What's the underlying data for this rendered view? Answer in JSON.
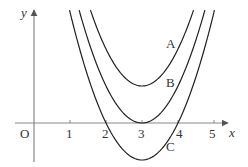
{
  "chart_data": {
    "type": "line",
    "title": "",
    "xlabel": "x",
    "ylabel": "y",
    "origin_label": "O",
    "x_ticks": [
      "1",
      "2",
      "3",
      "4",
      "5"
    ],
    "xlim": [
      -0.5,
      5.5
    ],
    "ylim": [
      -1.2,
      3.1
    ],
    "grid": false,
    "legend": "inline curve labels",
    "series": [
      {
        "name": "A",
        "equation": "y = (x-3)^2 + 1",
        "vertex": [
          3,
          1
        ],
        "x": [
          1.55,
          2,
          2.5,
          3,
          3.5,
          4,
          4.45
        ],
        "values": [
          3.1,
          2,
          1.25,
          1,
          1.25,
          2,
          3.1
        ]
      },
      {
        "name": "B",
        "equation": "y = (x-3)^2",
        "vertex": [
          3,
          0
        ],
        "x": [
          1.24,
          2,
          2.5,
          3,
          3.5,
          4,
          4.76
        ],
        "values": [
          3.1,
          1,
          0.25,
          0,
          0.25,
          1,
          3.1
        ]
      },
      {
        "name": "C",
        "equation": "y = (x-3)^2 - 1",
        "vertex": [
          3,
          -1
        ],
        "roots": [
          2,
          4
        ],
        "x": [
          0.96,
          2,
          2.5,
          3,
          3.5,
          4,
          5.04
        ],
        "values": [
          3.1,
          0,
          -0.75,
          -1,
          -0.75,
          0,
          3.1
        ]
      }
    ],
    "curve_labels": {
      "A": "A",
      "B": "B",
      "C": "C"
    }
  },
  "colors": {
    "axis": "#888888",
    "curve": "#222222",
    "text": "#333333"
  }
}
